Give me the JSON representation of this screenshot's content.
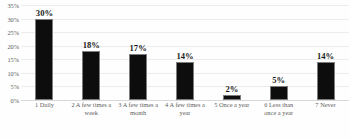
{
  "chart_data": {
    "type": "bar",
    "title": "",
    "subtitle": "",
    "xlabel": "",
    "ylabel": "",
    "ylim": [
      0,
      35
    ],
    "grid": true,
    "legend": false,
    "legend_position": "none",
    "orientation": "vertical",
    "bar_color": "#0d0d0d",
    "background_color": "#fefefe",
    "gridline_color": "#ececec",
    "categories": [
      "1 Daily",
      "2 A few times a week",
      "3 A few times a month",
      "4 A few times a year",
      "5 Once a year",
      "6 Less than once a year",
      "7 Never"
    ],
    "values": [
      30,
      18,
      17,
      14,
      2,
      5,
      14
    ],
    "data_labels": [
      "30%",
      "18%",
      "17%",
      "14%",
      "2%",
      "5%",
      "14%"
    ],
    "y_ticks": [
      35,
      30,
      25,
      20,
      15,
      10,
      5,
      0
    ],
    "y_tick_labels": [
      "35%",
      "30%",
      "25%",
      "20%",
      "15%",
      "10%",
      "5%",
      "0%"
    ]
  }
}
